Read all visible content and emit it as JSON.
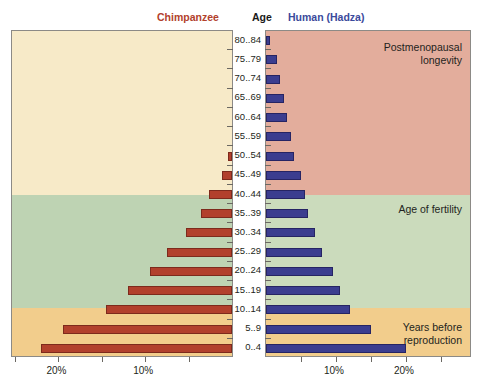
{
  "header": {
    "chimpanzee": "Chimpanzee",
    "age": "Age",
    "human": "Human (Hadza)"
  },
  "annotations": {
    "postmenopausal": "Postmenopausal\nlongevity",
    "fertility": "Age of fertility",
    "prereproduction": "Years before\nreproduction"
  },
  "axis": {
    "chimp_ticks": [
      "20%",
      "10%"
    ],
    "human_ticks": [
      "10%",
      "20%"
    ]
  },
  "colors": {
    "chimp_bar": "#b2402c",
    "human_bar": "#3b3d8f",
    "chimp_header": "#b2412c",
    "human_header": "#3b4a9c",
    "band_postmenopausal_human": "#e3ad9c",
    "band_fertility_human": "#cbdbbc",
    "band_prerepro": "#f2cd8c",
    "band_postmenopausal_chimp": "#f7eac8",
    "band_fertility_chimp": "#bed3b3"
  },
  "chart_data": {
    "type": "bar",
    "orientation": "horizontal",
    "layout": "back-to-back population pyramid",
    "xlabel": "",
    "ylabel": "Age",
    "categories": [
      "80..84",
      "75..79",
      "70..74",
      "65..69",
      "60..64",
      "55..59",
      "50..54",
      "45..49",
      "40..44",
      "35..39",
      "30..34",
      "25..29",
      "20..24",
      "15..19",
      "10..14",
      "5..9",
      "0..4"
    ],
    "series": [
      {
        "name": "Chimpanzee",
        "side": "left",
        "unit": "%",
        "xlim": [
          0,
          25
        ],
        "ticks": [
          20,
          10
        ],
        "values": [
          0,
          0,
          0,
          0,
          0,
          0,
          0.5,
          1.2,
          2.6,
          3.6,
          5.3,
          7.5,
          9.5,
          12.0,
          14.5,
          19.5,
          22.0
        ]
      },
      {
        "name": "Human (Hadza)",
        "side": "right",
        "unit": "%",
        "xlim": [
          0,
          29
        ],
        "ticks": [
          10,
          20
        ],
        "values": [
          0.5,
          1.5,
          2.0,
          2.5,
          3.0,
          3.5,
          4.0,
          5.0,
          5.5,
          6.0,
          7.0,
          8.0,
          9.5,
          10.5,
          12.0,
          15.0,
          20.0
        ]
      }
    ],
    "bands": [
      {
        "label": "Postmenopausal longevity",
        "ages": "45..84"
      },
      {
        "label": "Age of fertility",
        "ages": "15..44"
      },
      {
        "label": "Years before reproduction",
        "ages": "0..14"
      }
    ],
    "grid": false,
    "legend": "top headers"
  }
}
